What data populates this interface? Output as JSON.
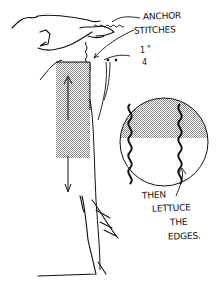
{
  "illustration": {
    "subject": "sewing lettuce-edge hem illustration",
    "colors": {
      "ink": "#111111",
      "background": "#ffffff",
      "shading": "#bdbdbd"
    },
    "labels": {
      "anchor_line1": "ANCHOR",
      "anchor_line2": "STITCHES",
      "fraction_numerator": "1",
      "fraction_denominator": "4",
      "fraction_mark": "\"",
      "then_line1": "THEN",
      "then_line2": "LETTUCE",
      "then_line3": "THE",
      "then_line4": "EDGES."
    }
  }
}
